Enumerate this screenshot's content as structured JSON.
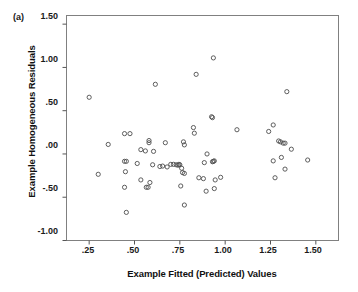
{
  "figure": {
    "panel_label": "(a)",
    "background_color": "#ffffff",
    "frame_color": "#808080",
    "marker_color": "#4d4d4d"
  },
  "chart_data": {
    "type": "scatter",
    "title": "",
    "panel": "(a)",
    "xlabel": "Example Fitted (Predicted) Values",
    "ylabel": "Example Homogeneous Residuals",
    "xlim": [
      0.125,
      1.625
    ],
    "ylim": [
      -1.0,
      1.6
    ],
    "xticks": [
      0.25,
      0.5,
      0.75,
      1.0,
      1.25,
      1.5
    ],
    "xtick_labels": [
      ".25",
      ".50",
      ".75",
      "1.00",
      "1.25",
      "1.50"
    ],
    "yticks": [
      -1.0,
      -0.5,
      0.0,
      0.5,
      1.0,
      1.5
    ],
    "ytick_labels": [
      "-1.00",
      "-.50",
      ".00",
      ".50",
      "1.00",
      "1.50"
    ],
    "grid": false,
    "legend": null,
    "marker": "open-circle",
    "marker_size": 3,
    "n_points": 79,
    "points": [
      [
        0.25,
        0.655
      ],
      [
        0.3,
        -0.235
      ],
      [
        0.355,
        0.11
      ],
      [
        0.445,
        0.235
      ],
      [
        0.445,
        -0.085
      ],
      [
        0.445,
        -0.385
      ],
      [
        0.455,
        -0.085
      ],
      [
        0.45,
        -0.205
      ],
      [
        0.455,
        -0.675
      ],
      [
        0.475,
        0.235
      ],
      [
        0.515,
        -0.11
      ],
      [
        0.535,
        0.05
      ],
      [
        0.535,
        -0.3
      ],
      [
        0.56,
        0.035
      ],
      [
        0.565,
        -0.385
      ],
      [
        0.575,
        -0.385
      ],
      [
        0.58,
        0.155
      ],
      [
        0.58,
        0.13
      ],
      [
        0.585,
        -0.33
      ],
      [
        0.6,
        -0.125
      ],
      [
        0.605,
        0.03
      ],
      [
        0.615,
        0.805
      ],
      [
        0.64,
        -0.145
      ],
      [
        0.655,
        -0.14
      ],
      [
        0.67,
        0.13
      ],
      [
        0.68,
        -0.15
      ],
      [
        0.7,
        -0.12
      ],
      [
        0.715,
        -0.12
      ],
      [
        0.73,
        -0.125
      ],
      [
        0.74,
        -0.13
      ],
      [
        0.745,
        -0.12
      ],
      [
        0.75,
        -0.125
      ],
      [
        0.755,
        -0.37
      ],
      [
        0.76,
        -0.165
      ],
      [
        0.765,
        -0.215
      ],
      [
        0.77,
        0.14
      ],
      [
        0.775,
        0.105
      ],
      [
        0.775,
        -0.225
      ],
      [
        0.775,
        -0.59
      ],
      [
        0.825,
        0.305
      ],
      [
        0.83,
        0.24
      ],
      [
        0.84,
        0.92
      ],
      [
        0.855,
        -0.275
      ],
      [
        0.88,
        -0.285
      ],
      [
        0.885,
        -0.1
      ],
      [
        0.895,
        -0.43
      ],
      [
        0.9,
        0.0
      ],
      [
        0.925,
        0.43
      ],
      [
        0.93,
        0.42
      ],
      [
        0.93,
        -0.09
      ],
      [
        0.935,
        -0.085
      ],
      [
        0.935,
        1.11
      ],
      [
        0.94,
        -0.08
      ],
      [
        0.94,
        -0.4
      ],
      [
        0.945,
        -0.3
      ],
      [
        0.975,
        -0.27
      ],
      [
        1.065,
        0.28
      ],
      [
        1.24,
        0.26
      ],
      [
        1.265,
        0.335
      ],
      [
        1.265,
        -0.08
      ],
      [
        1.275,
        -0.275
      ],
      [
        1.295,
        0.15
      ],
      [
        1.305,
        0.14
      ],
      [
        1.31,
        -0.04
      ],
      [
        1.32,
        0.125
      ],
      [
        1.33,
        0.125
      ],
      [
        1.33,
        -0.175
      ],
      [
        1.34,
        0.72
      ],
      [
        1.365,
        0.055
      ],
      [
        1.455,
        -0.07
      ]
    ]
  }
}
